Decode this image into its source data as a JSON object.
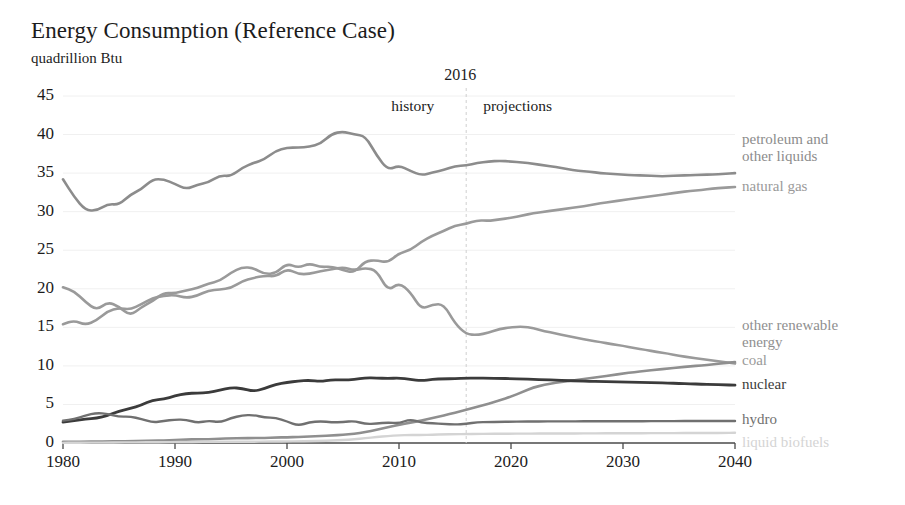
{
  "chart_data": {
    "type": "line",
    "title": "Energy Consumption (Reference Case)",
    "subtitle": "quadrillion Btu",
    "ylabel": "quadrillion Btu",
    "xlabel": "",
    "xlim": [
      1980,
      2040
    ],
    "ylim": [
      0,
      45
    ],
    "grid": true,
    "legend_position": "right",
    "xticks": [
      "1980",
      "1990",
      "2000",
      "2010",
      "2020",
      "2030",
      "2040"
    ],
    "yticks": [
      "0",
      "5",
      "10",
      "15",
      "20",
      "25",
      "30",
      "35",
      "40",
      "45"
    ],
    "annotations": {
      "divider_year": "2016",
      "left_label": "history",
      "right_label": "projections"
    },
    "x": [
      1980,
      1981,
      1982,
      1983,
      1984,
      1985,
      1986,
      1987,
      1988,
      1989,
      1990,
      1991,
      1992,
      1993,
      1994,
      1995,
      1996,
      1997,
      1998,
      1999,
      2000,
      2001,
      2002,
      2003,
      2004,
      2005,
      2006,
      2007,
      2008,
      2009,
      2010,
      2011,
      2012,
      2013,
      2014,
      2015,
      2016,
      2017,
      2018,
      2019,
      2020,
      2021,
      2022,
      2023,
      2024,
      2025,
      2026,
      2027,
      2028,
      2029,
      2030,
      2031,
      2032,
      2033,
      2034,
      2035,
      2036,
      2037,
      2038,
      2039,
      2040
    ],
    "series": [
      {
        "name": "petroleum and other liquids",
        "color": "#8c8c8c",
        "width": 2.6,
        "label_lines": [
          "petroleum and",
          "other liquids"
        ],
        "values": [
          34.2,
          31.9,
          30.2,
          30.1,
          31.0,
          30.9,
          32.2,
          32.9,
          34.2,
          34.2,
          33.6,
          32.9,
          33.5,
          33.8,
          34.7,
          34.6,
          35.7,
          36.3,
          36.8,
          37.9,
          38.3,
          38.3,
          38.4,
          38.8,
          40.1,
          40.4,
          40.0,
          39.8,
          37.3,
          35.4,
          36.0,
          35.3,
          34.7,
          35.1,
          35.4,
          35.9,
          36.0,
          36.3,
          36.5,
          36.6,
          36.5,
          36.4,
          36.2,
          36.0,
          35.8,
          35.5,
          35.3,
          35.2,
          35.0,
          34.9,
          34.8,
          34.7,
          34.7,
          34.6,
          34.6,
          34.7,
          34.7,
          34.8,
          34.8,
          34.9,
          35.0
        ]
      },
      {
        "name": "natural gas",
        "color": "#9a9a9a",
        "width": 2.6,
        "label_lines": [
          "natural gas"
        ],
        "values": [
          20.2,
          19.7,
          18.3,
          17.2,
          18.3,
          17.7,
          16.5,
          17.6,
          18.4,
          19.5,
          19.4,
          19.8,
          20.1,
          20.7,
          21.0,
          22.1,
          22.8,
          22.7,
          21.9,
          22.0,
          23.3,
          22.7,
          23.3,
          22.8,
          22.9,
          22.4,
          22.1,
          23.6,
          23.7,
          23.4,
          24.6,
          25.0,
          26.1,
          26.9,
          27.5,
          28.2,
          28.4,
          28.9,
          28.8,
          29.0,
          29.2,
          29.5,
          29.8,
          30.0,
          30.2,
          30.4,
          30.6,
          30.8,
          31.1,
          31.3,
          31.5,
          31.7,
          31.9,
          32.1,
          32.3,
          32.5,
          32.7,
          32.8,
          33.0,
          33.1,
          33.2
        ]
      },
      {
        "name": "coal",
        "color": "#9a9a9a",
        "width": 2.6,
        "label_lines": [
          "coal"
        ],
        "values": [
          15.4,
          15.9,
          15.3,
          15.9,
          17.1,
          17.5,
          17.3,
          18.0,
          18.8,
          19.1,
          19.2,
          18.8,
          19.1,
          19.8,
          19.9,
          20.1,
          21.0,
          21.4,
          21.7,
          21.6,
          22.6,
          21.9,
          21.9,
          22.3,
          22.5,
          22.8,
          22.4,
          22.7,
          22.4,
          19.7,
          20.8,
          19.6,
          17.3,
          18.0,
          18.0,
          15.5,
          14.1,
          14.0,
          14.3,
          14.8,
          15.0,
          15.1,
          14.9,
          14.5,
          14.2,
          13.9,
          13.6,
          13.3,
          13.1,
          12.8,
          12.6,
          12.3,
          12.1,
          11.8,
          11.6,
          11.3,
          11.1,
          10.9,
          10.7,
          10.5,
          10.3
        ]
      },
      {
        "name": "other renewable energy",
        "color": "#8f8f8f",
        "width": 2.6,
        "label_lines": [
          "other renewable",
          "energy"
        ],
        "values": [
          0.15,
          0.16,
          0.17,
          0.18,
          0.2,
          0.22,
          0.25,
          0.27,
          0.3,
          0.33,
          0.4,
          0.45,
          0.48,
          0.5,
          0.55,
          0.6,
          0.62,
          0.64,
          0.66,
          0.7,
          0.75,
          0.78,
          0.85,
          0.9,
          0.98,
          1.05,
          1.2,
          1.4,
          1.7,
          2.05,
          2.35,
          2.65,
          2.9,
          3.25,
          3.55,
          3.95,
          4.3,
          4.7,
          5.1,
          5.55,
          6.0,
          6.6,
          7.2,
          7.55,
          7.8,
          8.0,
          8.2,
          8.4,
          8.6,
          8.8,
          9.0,
          9.2,
          9.35,
          9.5,
          9.65,
          9.8,
          9.95,
          10.05,
          10.2,
          10.35,
          10.5
        ]
      },
      {
        "name": "nuclear",
        "color": "#3b3b3b",
        "width": 2.8,
        "label_lines": [
          "nuclear"
        ],
        "values": [
          2.7,
          2.9,
          3.1,
          3.2,
          3.55,
          4.15,
          4.47,
          4.91,
          5.59,
          5.68,
          6.1,
          6.42,
          6.48,
          6.52,
          6.84,
          7.18,
          7.09,
          6.68,
          7.07,
          7.61,
          7.86,
          8.03,
          8.14,
          7.96,
          8.22,
          8.16,
          8.21,
          8.46,
          8.43,
          8.36,
          8.43,
          8.26,
          8.06,
          8.27,
          8.33,
          8.34,
          8.43,
          8.42,
          8.4,
          8.38,
          8.35,
          8.3,
          8.25,
          8.2,
          8.15,
          8.1,
          8.05,
          8.0,
          7.98,
          7.95,
          7.92,
          7.88,
          7.85,
          7.82,
          7.78,
          7.72,
          7.68,
          7.62,
          7.58,
          7.54,
          7.5
        ]
      },
      {
        "name": "hydro",
        "color": "#707070",
        "width": 2.4,
        "label_lines": [
          "hydro"
        ],
        "values": [
          2.9,
          3.1,
          3.57,
          3.9,
          3.77,
          3.4,
          3.44,
          3.12,
          2.66,
          2.84,
          3.05,
          3.02,
          2.62,
          2.89,
          2.68,
          3.21,
          3.59,
          3.64,
          3.3,
          3.27,
          2.81,
          2.24,
          2.69,
          2.83,
          2.69,
          2.7,
          2.87,
          2.45,
          2.51,
          2.67,
          2.54,
          3.1,
          2.63,
          2.56,
          2.47,
          2.39,
          2.48,
          2.7,
          2.72,
          2.74,
          2.76,
          2.78,
          2.79,
          2.8,
          2.8,
          2.81,
          2.81,
          2.82,
          2.82,
          2.82,
          2.83,
          2.83,
          2.83,
          2.84,
          2.84,
          2.84,
          2.85,
          2.85,
          2.85,
          2.86,
          2.86
        ]
      },
      {
        "name": "liquid biofuels",
        "color": "#d4d4d4",
        "width": 2.4,
        "label_lines": [
          "liquid biofuels"
        ],
        "values": [
          0.02,
          0.03,
          0.04,
          0.05,
          0.06,
          0.07,
          0.08,
          0.09,
          0.1,
          0.11,
          0.12,
          0.13,
          0.14,
          0.15,
          0.16,
          0.17,
          0.15,
          0.17,
          0.18,
          0.19,
          0.2,
          0.22,
          0.25,
          0.28,
          0.32,
          0.38,
          0.48,
          0.62,
          0.78,
          0.9,
          1.0,
          1.05,
          1.02,
          1.08,
          1.12,
          1.14,
          1.16,
          1.18,
          1.19,
          1.2,
          1.21,
          1.22,
          1.22,
          1.23,
          1.23,
          1.24,
          1.24,
          1.25,
          1.25,
          1.26,
          1.26,
          1.27,
          1.27,
          1.28,
          1.28,
          1.29,
          1.29,
          1.3,
          1.3,
          1.31,
          1.32
        ]
      }
    ]
  }
}
